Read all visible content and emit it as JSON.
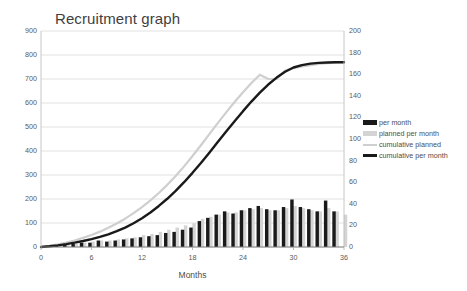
{
  "chart_data": {
    "type": "bar",
    "title": "Recruitment graph",
    "xlabel": "Months",
    "ylabel": "",
    "ylabel_right": "",
    "grid": true,
    "legend_position": "right",
    "x": [
      0,
      1,
      2,
      3,
      4,
      5,
      6,
      7,
      8,
      9,
      10,
      11,
      12,
      13,
      14,
      15,
      16,
      17,
      18,
      19,
      20,
      21,
      22,
      23,
      24,
      25,
      26,
      27,
      28,
      29,
      30,
      31,
      32,
      33,
      34,
      35,
      36
    ],
    "xlim": [
      0,
      36
    ],
    "xticks": [
      0,
      6,
      12,
      18,
      24,
      30,
      36
    ],
    "xtick_labels": [
      "0",
      "6",
      "12",
      "18",
      "24",
      "30",
      "36"
    ],
    "ylim": [
      0,
      900
    ],
    "yticks": [
      0,
      100,
      200,
      300,
      400,
      500,
      600,
      700,
      800,
      900
    ],
    "ytick_labels": [
      "0",
      "100",
      "200",
      "300",
      "400",
      "500",
      "600",
      "700",
      "800",
      "900"
    ],
    "ylim_right": [
      0,
      200
    ],
    "yticks_right": [
      0,
      20,
      40,
      60,
      80,
      100,
      120,
      140,
      160,
      180,
      200
    ],
    "ytick_labels_right": [
      "0",
      "20",
      "40",
      "60",
      "80",
      "100",
      "120",
      "140",
      "160",
      "180",
      "200"
    ],
    "series": [
      {
        "name": "per month",
        "type": "bar",
        "axis": "right",
        "color": "#1a1a1a",
        "values": [
          0,
          1,
          2,
          2,
          3,
          4,
          4,
          6,
          5,
          6,
          7,
          8,
          9,
          10,
          11,
          13,
          14,
          16,
          18,
          24,
          27,
          30,
          33,
          31,
          34,
          36,
          38,
          35,
          34,
          37,
          44,
          37,
          35,
          33,
          43,
          33,
          0
        ]
      },
      {
        "name": "planned per month",
        "type": "bar",
        "axis": "right",
        "color": "#d4d4d4",
        "values": [
          0,
          1,
          2,
          2,
          3,
          4,
          5,
          6,
          6,
          7,
          8,
          9,
          11,
          12,
          14,
          16,
          18,
          20,
          22,
          26,
          28,
          30,
          32,
          32,
          34,
          35,
          36,
          34,
          34,
          36,
          38,
          36,
          34,
          33,
          36,
          33,
          30
        ]
      },
      {
        "name": "cumulative planned",
        "type": "line",
        "axis": "left",
        "color": "#cfcfcf",
        "values": [
          0,
          5,
          11,
          18,
          27,
          38,
          50,
          64,
          80,
          98,
          118,
          141,
          166,
          194,
          225,
          259,
          296,
          336,
          379,
          424,
          470,
          516,
          561,
          604,
          645,
          683,
          718,
          700,
          700,
          735,
          745,
          752,
          758,
          763,
          766,
          768,
          770
        ]
      },
      {
        "name": "cumulative per month",
        "type": "line",
        "axis": "left",
        "color": "#1a1a1a",
        "values": [
          0,
          3,
          7,
          12,
          18,
          25,
          33,
          42,
          53,
          66,
          81,
          99,
          120,
          144,
          171,
          201,
          234,
          270,
          309,
          350,
          393,
          437,
          481,
          524,
          566,
          606,
          643,
          677,
          706,
          730,
          748,
          758,
          764,
          767,
          769,
          770,
          770
        ]
      }
    ]
  }
}
